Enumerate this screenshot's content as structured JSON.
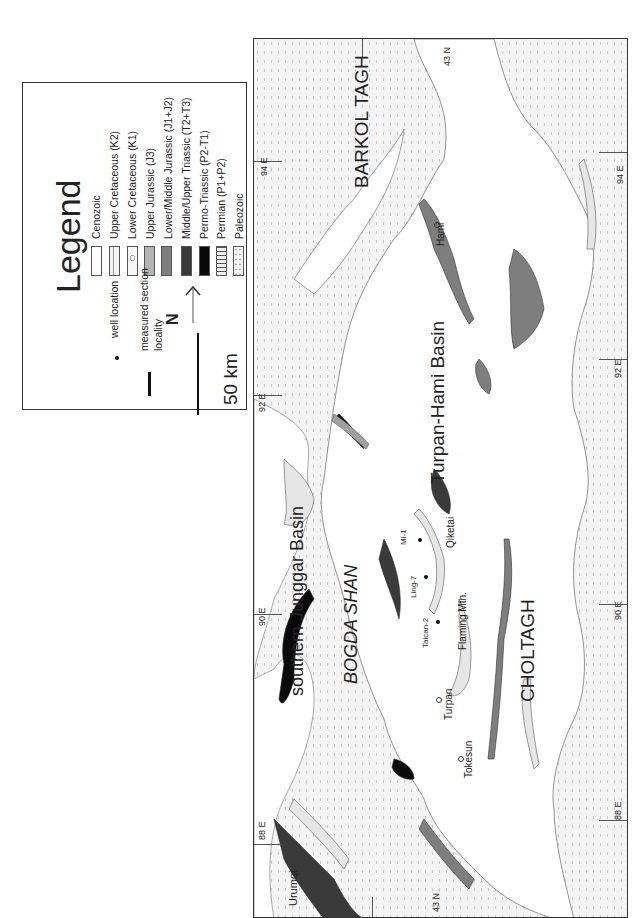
{
  "legend": {
    "title": "Legend",
    "units": [
      {
        "label": "Cenozoic",
        "fill": "#ffffff",
        "pattern": "none"
      },
      {
        "label": "Upper Cretaceous (K2)",
        "fill": "#f4f4f4",
        "pattern": "dash"
      },
      {
        "label": "Lower Cretaceous (K1)",
        "fill": "#f7f7f7",
        "pattern": "circle"
      },
      {
        "label": "Upper Jurassic (J3)",
        "fill": "#b4b4b4",
        "pattern": "none"
      },
      {
        "label": "Lower/Middle Jurassic (J1+J2)",
        "fill": "#7e7e7e",
        "pattern": "none"
      },
      {
        "label": "Middle/Upper Triassic (T2+T3)",
        "fill": "#3a3a3a",
        "pattern": "none"
      },
      {
        "label": "Permo-Triassic (P2-T1)",
        "fill": "#0a0a0a",
        "pattern": "none"
      },
      {
        "label": "Permian (P1+P2)",
        "fill": "#e6e6e6",
        "pattern": "stripes"
      },
      {
        "label": "Paleozoic",
        "fill": "#f2f2f2",
        "pattern": "dots"
      }
    ],
    "symbols": {
      "well": "well location",
      "section_line1": "measured section",
      "section_line2": "locality",
      "north": "N",
      "scale": "50 km"
    }
  },
  "map": {
    "regions": {
      "barkol": "BARKOL TAGH",
      "junggar": "southern Junggar Basin",
      "bogda": "BOGDA SHAN",
      "turpan_hami": "Turpan-Hami Basin",
      "choltagh": "CHOLTAGH"
    },
    "localities": {
      "hami": "Hami",
      "turpan": "Turpan",
      "tokesun": "Tokesun",
      "urumqi": "Urumqi",
      "qiketai": "Qiketai",
      "flaming": "Flaming Mtn.",
      "mi1": "Mi-1",
      "ling7": "Ling-7",
      "taican2": "Taican-2"
    },
    "graticule": {
      "lat_top": "43 N",
      "lat_bottom": "43 N",
      "lon94_left": "94 E",
      "lon94_right": "94 E",
      "lon92_left": "92 E",
      "lon92_right": "92 E",
      "lon90_left": "90 E",
      "lon90_right": "90 E",
      "lon88_left": "88 E",
      "lon88_right": "88 E"
    }
  }
}
